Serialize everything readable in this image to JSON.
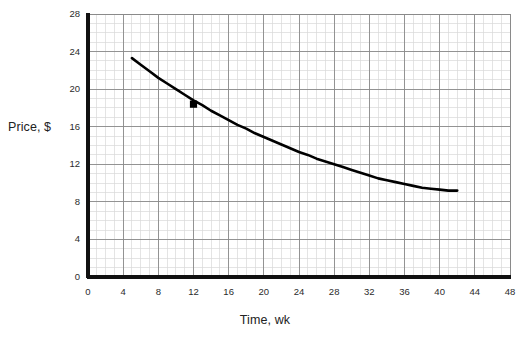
{
  "chart_data": {
    "type": "line",
    "title": "",
    "xlabel": "Time, wk",
    "ylabel": "Price, $",
    "xlim": [
      0,
      48
    ],
    "ylim": [
      0,
      28
    ],
    "xticks": [
      0,
      4,
      8,
      12,
      16,
      20,
      24,
      28,
      32,
      36,
      40,
      44,
      48
    ],
    "yticks": [
      0,
      4,
      8,
      12,
      16,
      20,
      24,
      28
    ],
    "grid": "minor-and-major",
    "minor_grid_step_x": 1,
    "minor_grid_step_y": 1,
    "legend": "none",
    "series": [
      {
        "name": "Price decay",
        "style": "solid-black-curve",
        "color": "#000000",
        "x": [
          5,
          6,
          7,
          8,
          9,
          10,
          11,
          12,
          13,
          14,
          15,
          16,
          17,
          18,
          19,
          20,
          21,
          22,
          23,
          24,
          25,
          26,
          27,
          28,
          29,
          30,
          31,
          32,
          33,
          34,
          35,
          36,
          37,
          38,
          39,
          40,
          41,
          42
        ],
        "y": [
          23.3,
          22.6,
          21.9,
          21.2,
          20.6,
          20.0,
          19.4,
          18.8,
          18.3,
          17.7,
          17.2,
          16.7,
          16.2,
          15.8,
          15.3,
          14.9,
          14.5,
          14.1,
          13.7,
          13.3,
          13.0,
          12.6,
          12.3,
          12.0,
          11.7,
          11.4,
          11.1,
          10.8,
          10.5,
          10.3,
          10.1,
          9.9,
          9.7,
          9.5,
          9.4,
          9.3,
          9.2,
          9.2
        ]
      }
    ],
    "markers": [
      {
        "name": "marked-point",
        "x": 12,
        "y": 18.4,
        "shape": "filled-square",
        "color": "#000000"
      }
    ],
    "axis_color": "#111111",
    "major_grid_color": "#8a8a8a",
    "minor_grid_color": "#d9d9d9",
    "background": "#ffffff"
  }
}
